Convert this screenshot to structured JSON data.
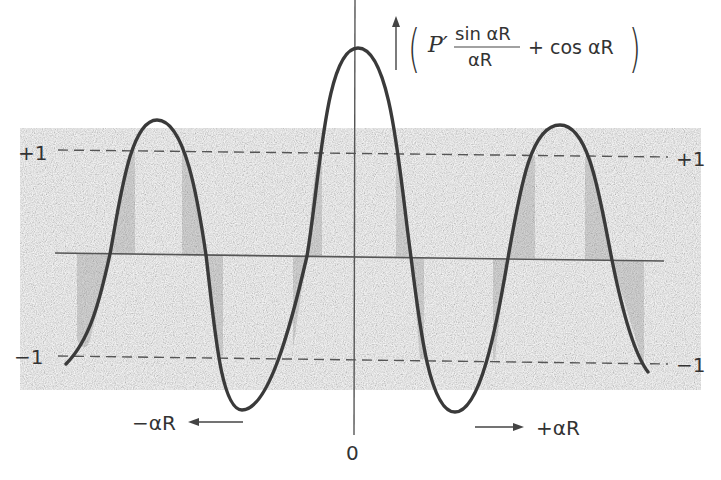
{
  "figure": {
    "type": "function-plot",
    "function_label": {
      "prefix": "P′",
      "numerator": "sin αR",
      "denominator": "αR",
      "suffix": "+ cos αR"
    },
    "y_axis": {
      "arrow": "up",
      "levels": [
        {
          "name": "plus-one",
          "label_left": "+1",
          "label_right": "+1",
          "value": 1
        },
        {
          "name": "minus-one",
          "label_left": "−1",
          "label_right": "−1",
          "value": -1
        }
      ]
    },
    "x_axis": {
      "origin_label": "0",
      "negative_label": "−αR",
      "positive_label": "+αR"
    },
    "shading": "allowed-band regions where curve lies between −1 and +1 are shaded",
    "colors": {
      "curve": "#3a3a3a",
      "axis": "#555555",
      "shade": "#d9d9d9",
      "text": "#333333"
    }
  }
}
